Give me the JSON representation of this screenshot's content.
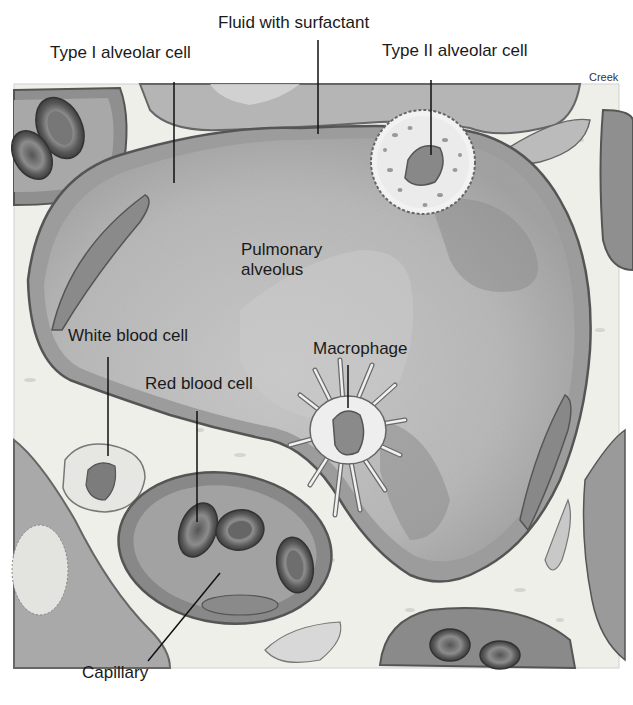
{
  "figure": {
    "credit": "Creek",
    "colors": {
      "background": "#ffffff",
      "interstitium": "#efefea",
      "alveolus_fill": "#bdbdbd",
      "alveolus_dark": "#9a9a9a",
      "cell_wall": "#8a8a8a",
      "outline": "#555555",
      "rbc": "#6b6b6b",
      "label_text": "#1a1a1a"
    }
  },
  "labels": {
    "fluid_with_surfactant": "Fluid with surfactant",
    "type_i_alveolar_cell": "Type I alveolar cell",
    "type_ii_alveolar_cell": "Type II alveolar cell",
    "pulmonary_alveolus": "Pulmonary\nalveolus",
    "white_blood_cell": "White blood cell",
    "macrophage": "Macrophage",
    "red_blood_cell": "Red blood cell",
    "capillary": "Capillary"
  }
}
